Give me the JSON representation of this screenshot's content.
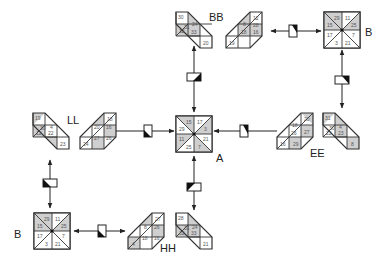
{
  "diagram": {
    "title": "",
    "colors": {
      "shade": "#cfcfcf",
      "line": "#333333",
      "background": "#ffffff",
      "text": "#555555"
    },
    "nodes": [
      {
        "id": "A",
        "label": "A",
        "shape": "square",
        "cx": 194,
        "cy": 134,
        "size": 36,
        "label_pos": [
          222,
          162
        ],
        "cells": [
          "15",
          "17",
          "3",
          "21",
          "7",
          "25",
          "11",
          "29"
        ]
      },
      {
        "id": "BB",
        "label": "BB",
        "shape": "diamond-pair",
        "label_pos": [
          207,
          21
        ],
        "left": {
          "cells": [
            "30",
            "31",
            "24",
            "32",
            "33",
            "20"
          ]
        },
        "right": {
          "cells": [
            "12",
            "8",
            "28",
            "18",
            "16",
            "19"
          ]
        }
      },
      {
        "id": "B_top",
        "label": "B",
        "shape": "square",
        "cx": 342,
        "cy": 30,
        "size": 36,
        "label_pos": [
          366,
          36
        ],
        "cells": [
          "29",
          "11",
          "25",
          "7",
          "21",
          "3",
          "17",
          "15"
        ]
      },
      {
        "id": "EE",
        "label": "EE",
        "shape": "diamond-pair",
        "label_pos": [
          310,
          155
        ],
        "left": {
          "cells": [
            "20",
            "18",
            "27",
            "26",
            "29",
            "16"
          ]
        },
        "right": {
          "cells": [
            "31",
            "30",
            "4",
            "22",
            "23",
            "8"
          ]
        }
      },
      {
        "id": "LL",
        "label": "LL",
        "shape": "diamond-pair",
        "label_pos": [
          67,
          124
        ],
        "left": {
          "cells": [
            "19",
            "30",
            "4",
            "12",
            "22",
            "23"
          ]
        },
        "right": {
          "cells": [
            "18",
            "20",
            "16",
            "27",
            "26",
            "24"
          ]
        }
      },
      {
        "id": "B_bottom",
        "label": "B",
        "shape": "square",
        "cx": 52,
        "cy": 231,
        "size": 36,
        "label_pos": [
          14,
          238
        ],
        "cells": [
          "29",
          "11",
          "25",
          "7",
          "21",
          "3",
          "17",
          "15"
        ]
      },
      {
        "id": "HH",
        "label": "HH",
        "shape": "diamond-pair",
        "label_pos": [
          165,
          252
        ],
        "left": {
          "cells": [
            "27",
            "8",
            "26",
            "18",
            "16",
            "4"
          ]
        },
        "right": {
          "cells": [
            "28",
            "31",
            "24",
            "32",
            "33",
            "21"
          ]
        }
      }
    ],
    "edges": [
      {
        "from": "A",
        "to": "BB",
        "direction": "bidirectional",
        "orientation": "vertical"
      },
      {
        "from": "BB",
        "to": "B_top",
        "direction": "bidirectional",
        "orientation": "horizontal"
      },
      {
        "from": "B_top",
        "to": "EE",
        "direction": "bidirectional",
        "orientation": "vertical"
      },
      {
        "from": "EE",
        "to": "A",
        "direction": "to-A",
        "orientation": "horizontal"
      },
      {
        "from": "LL",
        "to": "A",
        "direction": "bidirectional",
        "orientation": "horizontal"
      },
      {
        "from": "LL",
        "to": "B_bottom",
        "direction": "bidirectional",
        "orientation": "vertical"
      },
      {
        "from": "B_bottom",
        "to": "HH",
        "direction": "bidirectional",
        "orientation": "horizontal"
      },
      {
        "from": "HH",
        "to": "A",
        "direction": "bidirectional",
        "orientation": "vertical"
      }
    ]
  }
}
